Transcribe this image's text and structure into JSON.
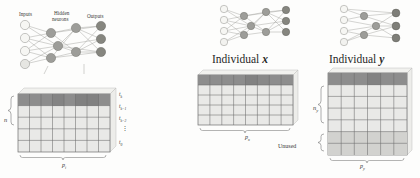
{
  "figure": {
    "title_left_labels": {
      "inputs": "Inputs",
      "hidden": "Hidden",
      "hidden2": "neurons",
      "outputs": "Outputs"
    },
    "colors": {
      "header_cell": "#8d8d8d",
      "body_cell": "#e9e9e7",
      "unused_cell": "#cfcfcc",
      "grid_line": "#6d6d6d",
      "node_input": "#f2f2ef",
      "node_hidden": "#9a9a96",
      "node_output": "#8a8a86",
      "edge": "#9b9b97",
      "text": "#272727"
    }
  },
  "left_panel": {
    "network": {
      "layers": [
        {
          "name": "inputs",
          "count": 4,
          "fill": "#f4f4f1"
        },
        {
          "name": "hidden-neurons",
          "count": 5,
          "fill": "#9e9e9a"
        },
        {
          "name": "outputs",
          "count": 4,
          "fill": "#8d8d89"
        }
      ]
    },
    "grid": {
      "rows": 5,
      "cols": 8,
      "row_labels": [
        "t_k",
        "t_k-1",
        "t_k-2",
        "⋮",
        "t_0"
      ],
      "row_labels_text": {
        "r0_base": "t",
        "r0_sub": "k",
        "r1_base": "t",
        "r1_sub": "k−1",
        "r2_base": "t",
        "r2_sub": "k−2",
        "r3": "⋮",
        "r4_base": "t",
        "r4_sub": "0"
      },
      "left_brace_label": "n",
      "bottom_label_base": "p",
      "bottom_label_sub": "i"
    }
  },
  "middle_panel": {
    "caption_prefix": "Individual",
    "caption_var": "x",
    "network": {
      "layers": [
        {
          "name": "inputs",
          "count": 4,
          "fill": "#f4f4f1"
        },
        {
          "name": "hidden-neurons",
          "count": 5,
          "fill": "#9e9e9a"
        },
        {
          "name": "outputs",
          "count": 4,
          "fill": "#8d8d89"
        }
      ]
    },
    "grid": {
      "rows": 5,
      "cols": 8,
      "header_rows": 1,
      "left_brace_label_base": "n",
      "left_brace_label_sub": "x",
      "bottom_label_base": "p",
      "bottom_label_sub": "x"
    }
  },
  "right_panel": {
    "caption_prefix": "Individual",
    "caption_var": "y",
    "network": {
      "layers": [
        {
          "name": "inputs",
          "count": 4,
          "fill": "#f4f4f1"
        },
        {
          "name": "hidden-neurons",
          "count": 4,
          "fill": "#9e9e9a"
        },
        {
          "name": "outputs",
          "count": 3,
          "fill": "#8d8d89"
        }
      ]
    },
    "grid": {
      "rows": 7,
      "cols": 6,
      "header_rows": 1,
      "unused_rows": 2,
      "left_brace_label_base": "n",
      "left_brace_label_sub": "y",
      "unused_label": "Unused",
      "bottom_label_base": "p",
      "bottom_label_sub": "y"
    }
  }
}
